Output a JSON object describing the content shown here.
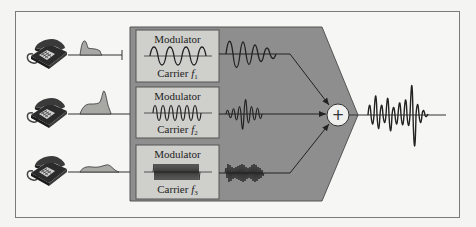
{
  "diagram": {
    "type": "frequency-division-multiplexing",
    "colors": {
      "background": "#f4f4f2",
      "frame": "#7a7a7a",
      "mux_block": "#8e8e8e",
      "mux_block_edge": "#555555",
      "modulator_box": "#cfcfcc",
      "signal_fill": "#a8a8a4",
      "line": "#333333"
    },
    "channels": [
      {
        "id": 1,
        "source": "telephone",
        "baseband_shape": "peak-then-plateau",
        "modulator_label": "Modulator",
        "carrier_label": "Carrier ",
        "carrier_symbol": "f",
        "carrier_subscript": "1",
        "carrier_cycles": 4
      },
      {
        "id": 2,
        "source": "telephone",
        "baseband_shape": "rising-double-peak",
        "modulator_label": "Modulator",
        "carrier_label": "Carrier ",
        "carrier_symbol": "f",
        "carrier_subscript": "2",
        "carrier_cycles": 6
      },
      {
        "id": 3,
        "source": "telephone",
        "baseband_shape": "low-undulating",
        "modulator_label": "Modulator",
        "carrier_label": "Carrier ",
        "carrier_symbol": "f",
        "carrier_subscript": "3",
        "carrier_cycles": 10
      }
    ],
    "combiner": {
      "symbol": "+",
      "name": "summing-junction"
    },
    "output": {
      "description": "composite multiplexed signal"
    }
  }
}
